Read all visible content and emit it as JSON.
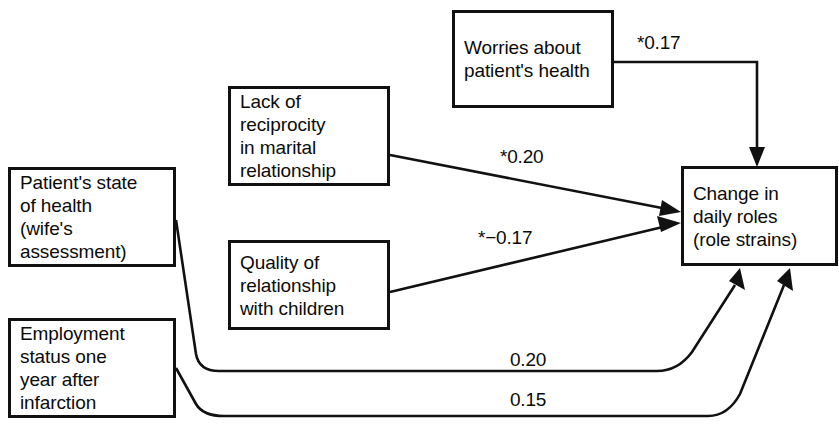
{
  "figure": {
    "type": "path-diagram",
    "background_color": "#ffffff",
    "line_color": "#111111",
    "text_color": "#0b0b0b"
  },
  "nodes": [
    {
      "id": "patient-state-of-health",
      "label": "Patient's state\nof health\n(wife's\nassessment)",
      "x": 8,
      "y": 167,
      "w": 168,
      "h": 100
    },
    {
      "id": "employment-status",
      "label": "Employment\nstatus one\nyear after\ninfarction",
      "x": 8,
      "y": 318,
      "w": 168,
      "h": 100
    },
    {
      "id": "lack-of-reciprocity",
      "label": "Lack of\nreciprocity\nin marital\nrelationship",
      "x": 228,
      "y": 86,
      "w": 162,
      "h": 100
    },
    {
      "id": "quality-of-relationship",
      "label": "Quality of\nrelationship\nwith children",
      "x": 228,
      "y": 240,
      "w": 162,
      "h": 90
    },
    {
      "id": "worries-about-health",
      "label": "Worries about\npatient's health",
      "x": 452,
      "y": 10,
      "w": 162,
      "h": 98
    },
    {
      "id": "change-in-daily-roles",
      "label": "Change in\ndaily roles\n(role strains)",
      "x": 681,
      "y": 166,
      "w": 157,
      "h": 100
    }
  ],
  "edges": [
    {
      "id": "worries-to-change",
      "from": "worries-about-health",
      "to": "change-in-daily-roles",
      "coefficient": "*0.17",
      "label_x": 637,
      "label_y": 33
    },
    {
      "id": "reciprocity-to-change",
      "from": "lack-of-reciprocity",
      "to": "change-in-daily-roles",
      "coefficient": "*0.20",
      "label_x": 500,
      "label_y": 147
    },
    {
      "id": "quality-to-change",
      "from": "quality-of-relationship",
      "to": "change-in-daily-roles",
      "coefficient": "*−0.17",
      "label_x": 478,
      "label_y": 228
    },
    {
      "id": "patient-state-to-change",
      "from": "patient-state-of-health",
      "to": "change-in-daily-roles",
      "coefficient": "0.20",
      "label_x": 510,
      "label_y": 350
    },
    {
      "id": "employment-to-change",
      "from": "employment-status",
      "to": "change-in-daily-roles",
      "coefficient": "0.15",
      "label_x": 510,
      "label_y": 390
    }
  ]
}
